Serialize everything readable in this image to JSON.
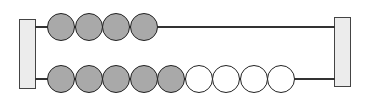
{
  "diagram": {
    "type": "abacus",
    "rows": [
      {
        "name": "top-rod",
        "beads": [
          "gray",
          "gray",
          "gray",
          "gray"
        ]
      },
      {
        "name": "bottom-rod",
        "beads": [
          "gray",
          "gray",
          "gray",
          "gray",
          "gray",
          "white",
          "white",
          "white",
          "white"
        ]
      }
    ],
    "colors": {
      "gray": "#a9a9a9",
      "white": "#ffffff",
      "post": "#ececec",
      "outline": "#222222"
    }
  }
}
